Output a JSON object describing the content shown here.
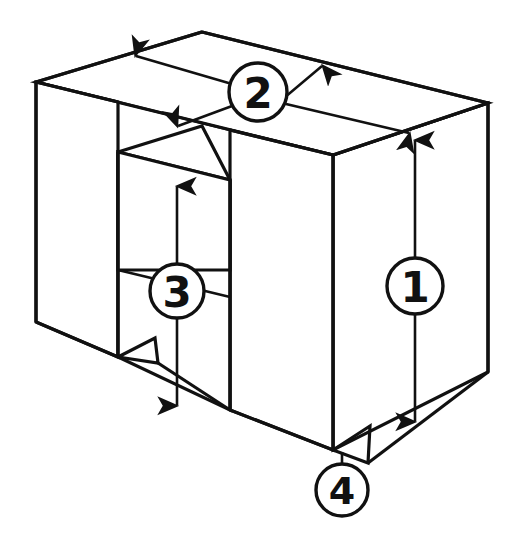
{
  "figure": {
    "type": "isometric-engineering-drawing",
    "background_color": "#ffffff",
    "line_color": "#111111",
    "width": 521,
    "height": 548
  },
  "callouts": [
    {
      "id": "callout-1",
      "label": "1",
      "dimension_axis": "vertical",
      "description": "overall height of block, right front edge",
      "circle": {
        "cx": 415,
        "cy": 286,
        "r": 28
      },
      "leader": {
        "x1": 415,
        "y1": 137,
        "x2": 415,
        "y2": 425
      },
      "arrows": [
        "up",
        "down"
      ]
    },
    {
      "id": "callout-2",
      "label": "2",
      "dimension_axis": "depth",
      "description": "top face depth between back and front top edges",
      "circle": {
        "cx": 258,
        "cy": 92,
        "r": 29
      },
      "leader_upper": {
        "x1": 258,
        "y1": 92,
        "x2": 133,
        "y2": 55
      },
      "leader_upper_right": {
        "x1": 258,
        "y1": 92,
        "x2": 325,
        "y2": 65
      },
      "leader_lower": {
        "x1": 258,
        "y1": 92,
        "x2": 175,
        "y2": 127
      },
      "leader_lower_right": {
        "x1": 258,
        "y1": 92,
        "x2": 412,
        "y2": 134
      },
      "arrows": [
        "left",
        "right"
      ]
    },
    {
      "id": "callout-3",
      "label": "3",
      "dimension_axis": "vertical",
      "description": "depth of the rectangular slot",
      "circle": {
        "cx": 177,
        "cy": 291,
        "r": 27
      },
      "leader": {
        "x1": 177,
        "y1": 183,
        "x2": 177,
        "y2": 409
      },
      "arrows": [
        "up",
        "down"
      ]
    },
    {
      "id": "callout-4",
      "label": "4",
      "dimension_axis": "feature",
      "description": "V-notch at the bottom front edge",
      "circle": {
        "cx": 342,
        "cy": 490,
        "r": 26
      },
      "leader": {
        "x1": 342,
        "y1": 464,
        "x2": 342,
        "y2": 450
      },
      "arrows": []
    }
  ],
  "geometry": {
    "block": {
      "top_back_left": [
        202,
        32
      ],
      "top_front_left": [
        36,
        82
      ],
      "top_back_right": [
        488,
        103
      ],
      "top_front_right": [
        333,
        155
      ],
      "bottom_front_left": [
        36,
        322
      ],
      "bottom_front_right": [
        333,
        450
      ],
      "bottom_back_right": [
        488,
        372
      ]
    },
    "slot": {
      "left_edge_x": 118,
      "right_edge_x": 230,
      "top_back_y": 152,
      "floor_y": 270,
      "bottom_front_y": 357
    },
    "notches": [
      {
        "name": "front-bottom-notch",
        "peak": [
          370,
          426
        ],
        "base_left": [
          333,
          450
        ],
        "base_right": [
          368,
          463
        ]
      },
      {
        "name": "slot-bottom-notch",
        "peak": [
          155,
          338
        ],
        "base_left": [
          118,
          357
        ],
        "base_right": [
          158,
          363
        ]
      }
    ]
  }
}
